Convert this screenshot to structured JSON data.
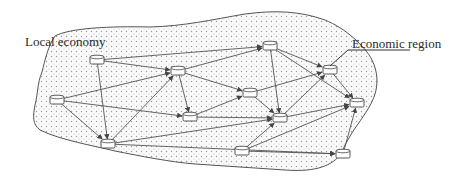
{
  "labels": {
    "local_economy": "Local economy",
    "economic_region": "Economic region"
  },
  "colors": {
    "line": "#555555",
    "region_fill": "#f4f4f4",
    "dot": "#9a9a9a",
    "node_fill": "#ffffff"
  },
  "nodes": [
    {
      "id": "n1",
      "x": 97,
      "y": 60
    },
    {
      "id": "n2",
      "x": 178,
      "y": 71
    },
    {
      "id": "n3",
      "x": 57,
      "y": 100
    },
    {
      "id": "n4",
      "x": 108,
      "y": 144
    },
    {
      "id": "n5",
      "x": 270,
      "y": 46
    },
    {
      "id": "n6",
      "x": 250,
      "y": 93
    },
    {
      "id": "n7",
      "x": 190,
      "y": 117
    },
    {
      "id": "n8",
      "x": 280,
      "y": 118
    },
    {
      "id": "n9",
      "x": 330,
      "y": 70
    },
    {
      "id": "n10",
      "x": 357,
      "y": 103
    },
    {
      "id": "n11",
      "x": 242,
      "y": 151
    },
    {
      "id": "n12",
      "x": 343,
      "y": 154
    }
  ],
  "edges": [
    [
      "n1",
      "n2"
    ],
    [
      "n1",
      "n4"
    ],
    [
      "n1",
      "n5"
    ],
    [
      "n3",
      "n2"
    ],
    [
      "n3",
      "n4"
    ],
    [
      "n3",
      "n7"
    ],
    [
      "n4",
      "n2"
    ],
    [
      "n4",
      "n8"
    ],
    [
      "n4",
      "n12"
    ],
    [
      "n2",
      "n5"
    ],
    [
      "n2",
      "n7"
    ],
    [
      "n2",
      "n6"
    ],
    [
      "n5",
      "n9"
    ],
    [
      "n5",
      "n8"
    ],
    [
      "n5",
      "n10"
    ],
    [
      "n6",
      "n8"
    ],
    [
      "n6",
      "n9"
    ],
    [
      "n7",
      "n8"
    ],
    [
      "n7",
      "n6"
    ],
    [
      "n8",
      "n9"
    ],
    [
      "n8",
      "n10"
    ],
    [
      "n11",
      "n8"
    ],
    [
      "n11",
      "n10"
    ],
    [
      "n11",
      "n12"
    ],
    [
      "n9",
      "n10"
    ],
    [
      "n12",
      "n10"
    ]
  ]
}
